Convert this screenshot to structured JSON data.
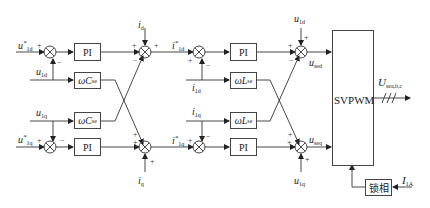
{
  "diagram": {
    "type": "block-diagram",
    "title": "",
    "blocks": {
      "pi_d_voltage": "PI",
      "pi_q_voltage": "PI",
      "pi_d_current": "PI",
      "pi_q_current": "PI",
      "decouple_c_d": "ωC",
      "decouple_c_d_sub": "se",
      "decouple_c_q": "ωC",
      "decouple_c_q_sub": "se",
      "decouple_l_d": "ωL",
      "decouple_l_d_sub": "se",
      "decouple_l_q": "ωL",
      "decouple_l_q_sub": "se",
      "svpwm": "SVPWM",
      "pll": "锁相"
    },
    "signals": {
      "u1d_ref": "u",
      "u1d_ref_sub": "1d",
      "u1d": "u",
      "u1d_sub": "1d",
      "u1q": "u",
      "u1q_sub": "1q",
      "u1q_ref": "u",
      "u1q_ref_sub": "1q",
      "id": "i",
      "id_sub": "d",
      "iq": "i",
      "iq_sub": "q",
      "i1d_ref": "i",
      "i1d_ref_sub": "1d",
      "i1q_ref": "i",
      "i1q_ref_sub": "1q",
      "i1d": "i",
      "i1d_sub": "1d",
      "i1q": "i",
      "i1q_sub": "1q",
      "u1d_ff": "u",
      "u1d_ff_sub": "1d",
      "u1q_ff": "u",
      "u1q_ff_sub": "1q",
      "used": "u",
      "used_sub": "sed",
      "useq": "u",
      "useq_sub": "seq",
      "output": "U",
      "output_sub": "sea,b,c",
      "pll_input": "I",
      "pll_input_sub": "1A"
    },
    "signs": {
      "plus": "+",
      "minus": "−"
    }
  }
}
